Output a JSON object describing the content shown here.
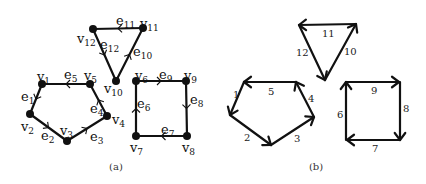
{
  "figure": {
    "panel_a": {
      "caption": "(a)",
      "vertices": [
        {
          "id": "v1",
          "name": "v",
          "sub": "1",
          "x": 42,
          "y": 84,
          "lx": 37,
          "ly": 81
        },
        {
          "id": "v2",
          "name": "v",
          "sub": "2",
          "x": 30,
          "y": 114,
          "lx": 21,
          "ly": 131
        },
        {
          "id": "v3",
          "name": "v",
          "sub": "3",
          "x": 67,
          "y": 141,
          "lx": 60,
          "ly": 135
        },
        {
          "id": "v4",
          "name": "v",
          "sub": "4",
          "x": 107,
          "y": 116,
          "lx": 112,
          "ly": 124
        },
        {
          "id": "v5",
          "name": "v",
          "sub": "5",
          "x": 90,
          "y": 84,
          "lx": 84,
          "ly": 80
        },
        {
          "id": "v6",
          "name": "v",
          "sub": "6",
          "x": 136,
          "y": 81,
          "lx": 135,
          "ly": 80
        },
        {
          "id": "v7",
          "name": "v",
          "sub": "7",
          "x": 136,
          "y": 136,
          "lx": 130,
          "ly": 152
        },
        {
          "id": "v8",
          "name": "v",
          "sub": "8",
          "x": 187,
          "y": 136,
          "lx": 182,
          "ly": 152
        },
        {
          "id": "v9",
          "name": "v",
          "sub": "9",
          "x": 186,
          "y": 81,
          "lx": 184,
          "ly": 80
        },
        {
          "id": "v10",
          "name": "v",
          "sub": "10",
          "x": 116,
          "y": 81,
          "lx": 104,
          "ly": 93
        },
        {
          "id": "v11",
          "name": "v",
          "sub": "11",
          "x": 143,
          "y": 28,
          "lx": 140,
          "ly": 28
        },
        {
          "id": "v12",
          "name": "v",
          "sub": "12",
          "x": 93,
          "y": 29,
          "lx": 77,
          "ly": 43
        }
      ],
      "edges": [
        {
          "id": "e1",
          "name": "e",
          "sub": "1",
          "from": "v1",
          "to": "v2",
          "lx": 21,
          "ly": 101
        },
        {
          "id": "e2",
          "name": "e",
          "sub": "2",
          "from": "v2",
          "to": "v3",
          "lx": 41,
          "ly": 140
        },
        {
          "id": "e3",
          "name": "e",
          "sub": "3",
          "from": "v3",
          "to": "v4",
          "lx": 90,
          "ly": 141
        },
        {
          "id": "e4",
          "name": "e",
          "sub": "4",
          "from": "v4",
          "to": "v5",
          "lx": 90,
          "ly": 113
        },
        {
          "id": "e5",
          "name": "e",
          "sub": "5",
          "from": "v5",
          "to": "v1",
          "lx": 64,
          "ly": 79
        },
        {
          "id": "e6",
          "name": "e",
          "sub": "6",
          "from": "v7",
          "to": "v6",
          "lx": 137,
          "ly": 108
        },
        {
          "id": "e7",
          "name": "e",
          "sub": "7",
          "from": "v8",
          "to": "v7",
          "lx": 161,
          "ly": 134
        },
        {
          "id": "e8",
          "name": "e",
          "sub": "8",
          "from": "v9",
          "to": "v8",
          "lx": 190,
          "ly": 104
        },
        {
          "id": "e9",
          "name": "e",
          "sub": "9",
          "from": "v6",
          "to": "v9",
          "lx": 159,
          "ly": 79
        },
        {
          "id": "e10",
          "name": "e",
          "sub": "10",
          "from": "v10",
          "to": "v11",
          "lx": 133,
          "ly": 56
        },
        {
          "id": "e11",
          "name": "e",
          "sub": "11",
          "from": "v11",
          "to": "v12",
          "lx": 116,
          "ly": 25
        },
        {
          "id": "e12",
          "name": "e",
          "sub": "12",
          "from": "v12",
          "to": "v10",
          "lx": 100,
          "ly": 49
        }
      ]
    },
    "panel_b": {
      "caption": "(b)",
      "arrows": [
        {
          "label": "1",
          "x1": 244,
          "y1": 82,
          "x2": 230,
          "y2": 115,
          "lx": 233,
          "ly": 98
        },
        {
          "label": "2",
          "x1": 230,
          "y1": 115,
          "x2": 271,
          "y2": 145,
          "lx": 244,
          "ly": 141
        },
        {
          "label": "3",
          "x1": 271,
          "y1": 145,
          "x2": 314,
          "y2": 117,
          "lx": 294,
          "ly": 142
        },
        {
          "label": "4",
          "x1": 314,
          "y1": 117,
          "x2": 296,
          "y2": 82,
          "lx": 308,
          "ly": 102
        },
        {
          "label": "5",
          "x1": 296,
          "y1": 82,
          "x2": 244,
          "y2": 82,
          "lx": 268,
          "ly": 95
        },
        {
          "label": "6",
          "x1": 346,
          "y1": 140,
          "x2": 346,
          "y2": 82,
          "lx": 337,
          "ly": 118
        },
        {
          "label": "7",
          "x1": 400,
          "y1": 140,
          "x2": 347,
          "y2": 140,
          "lx": 372,
          "ly": 152
        },
        {
          "label": "8",
          "x1": 400,
          "y1": 82,
          "x2": 400,
          "y2": 140,
          "lx": 403,
          "ly": 112
        },
        {
          "label": "9",
          "x1": 346,
          "y1": 82,
          "x2": 399,
          "y2": 82,
          "lx": 371,
          "ly": 94
        },
        {
          "label": "10",
          "x1": 325,
          "y1": 80,
          "x2": 356,
          "y2": 24,
          "lx": 344,
          "ly": 55
        },
        {
          "label": "11",
          "x1": 356,
          "y1": 24,
          "x2": 299,
          "y2": 25,
          "lx": 322,
          "ly": 37
        },
        {
          "label": "12",
          "x1": 299,
          "y1": 25,
          "x2": 325,
          "y2": 80,
          "lx": 296,
          "ly": 56
        }
      ]
    }
  }
}
